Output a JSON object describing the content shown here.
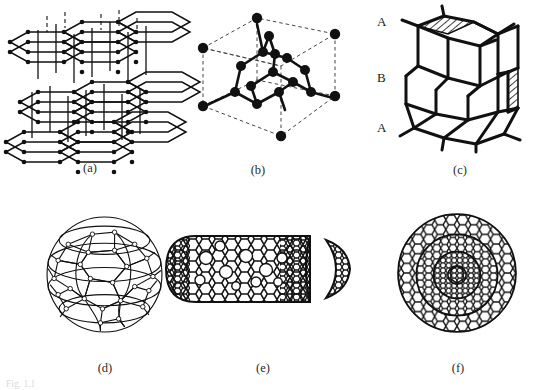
{
  "figure": {
    "background_color": "#ffffff",
    "ink_color": "#111111",
    "panel_count": 6
  },
  "panels": [
    {
      "id": "a",
      "caption": "(a)",
      "name": "graphite-layered-structure",
      "structure": "graphite",
      "description": "three stacked hexagonal sheets joined by vertical interlayer lines",
      "layers": 3,
      "cells_per_layer": 3
    },
    {
      "id": "b",
      "caption": "(b)",
      "name": "diamond-cubic-unit-cell",
      "structure": "diamond cubic",
      "description": "dashed cube outline with tetrahedrally bonded atoms inside",
      "corner_atoms": 8,
      "interior_atoms": 10
    },
    {
      "id": "c",
      "caption": "(c)",
      "name": "hexagonal-diamond-lonsdaleite",
      "structure": "lonsdaleite",
      "description": "hexagonal diamond with ABA stacking, hatched faces",
      "stacking_labels": [
        "A",
        "B",
        "A"
      ]
    },
    {
      "id": "d",
      "caption": "(d)",
      "name": "c60-fullerene",
      "structure": "C60 buckminsterfullerene",
      "description": "spherical cage of hexagons and pentagons"
    },
    {
      "id": "e",
      "caption": "(e)",
      "name": "carbon-nanotube",
      "structure": "carbon nanotube",
      "description": "capped cylindrical tube with detached end cap at right"
    },
    {
      "id": "f",
      "caption": "(f)",
      "name": "carbon-onion",
      "structure": "carbon onion",
      "description": "concentric nested fullerene shells",
      "shells": 3
    }
  ],
  "stacking_labels": {
    "top": "A",
    "middle": "B",
    "bottom": "A"
  },
  "bottom_caption_trace": "Fig. 1.1"
}
